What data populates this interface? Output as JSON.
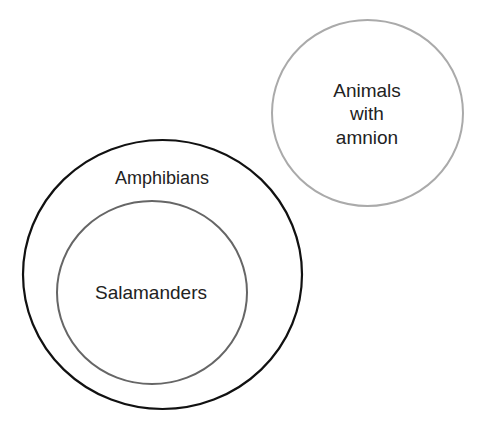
{
  "diagram": {
    "type": "euler",
    "sets": [
      {
        "id": "amphibians",
        "label": "Amphibians",
        "stroke": "#111111",
        "shape": {
          "cx": 162.5,
          "cy": 274.5,
          "rx": 139.5,
          "ry": 134.5
        }
      },
      {
        "id": "salamanders",
        "label": "Salamanders",
        "parent": "amphibians",
        "stroke": "#666666",
        "shape": {
          "cx": 152,
          "cy": 292.5,
          "rx": 95,
          "ry": 91.5
        }
      },
      {
        "id": "amnion",
        "label_lines": [
          "Animals",
          "with",
          "amnion"
        ],
        "stroke": "#aaaaaa",
        "shape": {
          "cx": 367.5,
          "cy": 113,
          "rx": 95.5,
          "ry": 93
        }
      }
    ],
    "relations": [
      "Salamanders is a subset of Amphibians",
      "Animals with amnion is disjoint from Amphibians"
    ]
  }
}
